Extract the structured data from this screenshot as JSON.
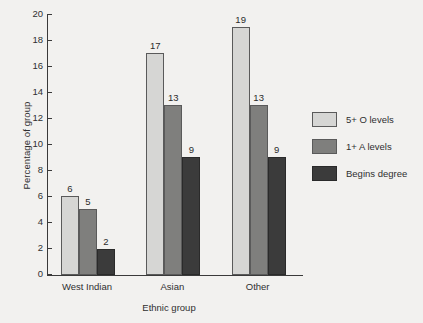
{
  "chart_data": {
    "type": "bar",
    "title": "",
    "subtitle": "",
    "xlabel": "Ethnic group",
    "ylabel": "Percentage of group",
    "categories": [
      "West Indian",
      "Asian",
      "Other"
    ],
    "series": [
      {
        "name": "5+ O levels",
        "color": "#d6d6d4",
        "values": [
          6,
          17,
          19
        ]
      },
      {
        "name": "1+ A levels",
        "color": "#7f7f7d",
        "values": [
          5,
          13,
          13
        ]
      },
      {
        "name": "Begins degree",
        "color": "#3b3b3b",
        "values": [
          2,
          9,
          9
        ]
      }
    ],
    "ylim": [
      0,
      20
    ],
    "ytick_step": 2,
    "ytick_labels": [
      "0",
      "2",
      "4",
      "6",
      "8",
      "10",
      "12",
      "14",
      "16",
      "18",
      "20"
    ],
    "grid": false,
    "data_labels": true,
    "legend_position": "right",
    "axis_color": "#3a3a3a",
    "background_color": "#f2f1ef"
  },
  "legend": {
    "items": [
      {
        "label": "5+ O levels"
      },
      {
        "label": "1+ A levels"
      },
      {
        "label": "Begins degree"
      }
    ]
  }
}
